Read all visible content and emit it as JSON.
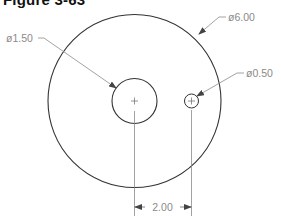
{
  "figure": {
    "title": "Figure 3-63"
  },
  "drawing": {
    "colors": {
      "outline": "#333333",
      "dimension": "#8a8a8a",
      "background": "#ffffff"
    },
    "circles": [
      {
        "name": "outer",
        "diameter_label": "ø6.00"
      },
      {
        "name": "medium",
        "diameter_label": "ø1.50"
      },
      {
        "name": "small",
        "diameter_label": "ø0.50"
      }
    ],
    "linear_dimension": {
      "label": "2.00"
    }
  }
}
